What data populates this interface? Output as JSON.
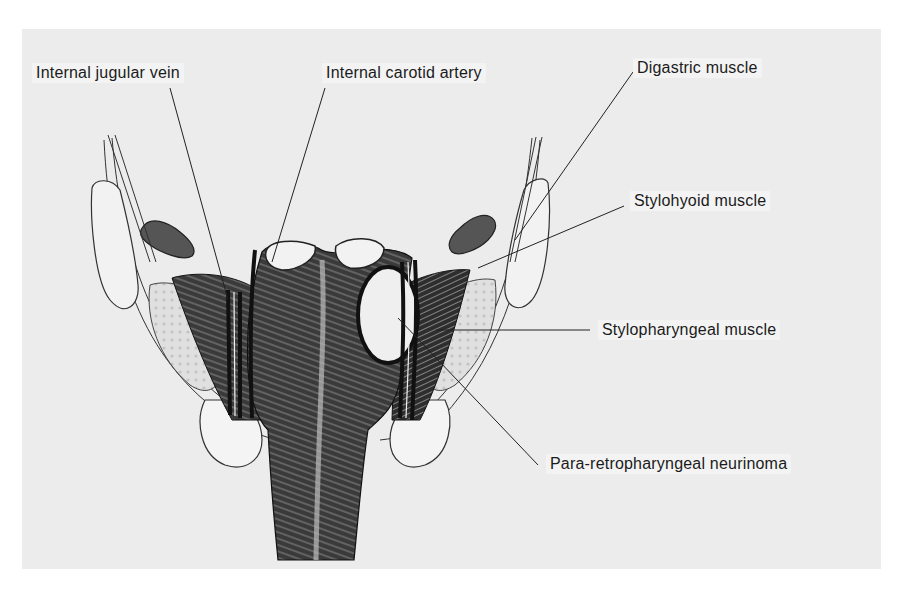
{
  "figure": {
    "background": "#ececec",
    "labels": [
      {
        "id": "internal-jugular-vein",
        "text": "Internal jugular vein",
        "x": 32,
        "y": 63
      },
      {
        "id": "internal-carotid-artery",
        "text": "Internal carotid artery",
        "x": 322,
        "y": 63
      },
      {
        "id": "digastric-muscle",
        "text": "Digastric muscle",
        "x": 633,
        "y": 58
      },
      {
        "id": "stylohyoid-muscle",
        "text": "Stylohyoid muscle",
        "x": 630,
        "y": 191
      },
      {
        "id": "stylopharyngeal-muscle",
        "text": "Stylopharyngeal muscle",
        "x": 598,
        "y": 320
      },
      {
        "id": "para-retropharyngeal-neurinoma",
        "text": "Para-retropharyngeal neurinoma",
        "x": 546,
        "y": 454
      }
    ]
  }
}
